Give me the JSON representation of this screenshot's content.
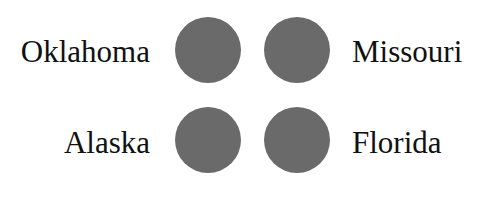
{
  "dot_color": "#6a6a6a",
  "grid": {
    "rows": [
      {
        "left_label": "Oklahoma",
        "right_label": "Missouri"
      },
      {
        "left_label": "Alaska",
        "right_label": "Florida"
      }
    ]
  }
}
